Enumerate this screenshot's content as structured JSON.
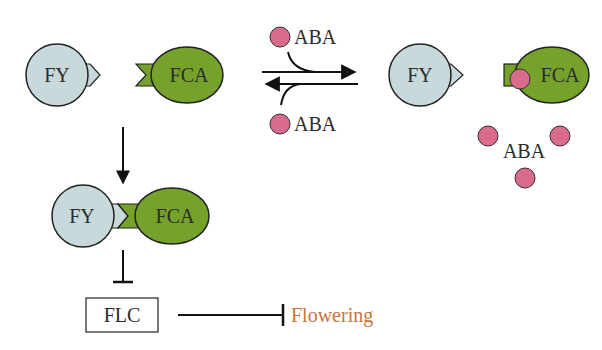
{
  "colors": {
    "fy_fill": "#c7d9da",
    "fca_fill": "#76a12a",
    "aba_fill": "#d96a8c",
    "stroke": "#222222",
    "flowering_text": "#c8743c"
  },
  "nodes": {
    "fy_free": "FY",
    "fca_free": "FCA",
    "fy_bound_right": "FY",
    "fca_aba_bound": "FCA",
    "fy_complex": "FY",
    "fca_complex": "FCA",
    "aba_top": "ABA",
    "aba_bottom": "ABA",
    "aba_free_cluster": "ABA",
    "flc": "FLC",
    "flowering": "Flowering"
  },
  "edges": [
    {
      "from": "FY + FCA",
      "to": "FY-FCA complex",
      "type": "arrow"
    },
    {
      "from": "FY-FCA complex",
      "to": "FLC",
      "type": "inhibition"
    },
    {
      "from": "FLC",
      "to": "Flowering",
      "type": "inhibition"
    },
    {
      "from": "FY + FCA + ABA",
      "to": "FY + FCA-ABA",
      "type": "reversible"
    }
  ]
}
